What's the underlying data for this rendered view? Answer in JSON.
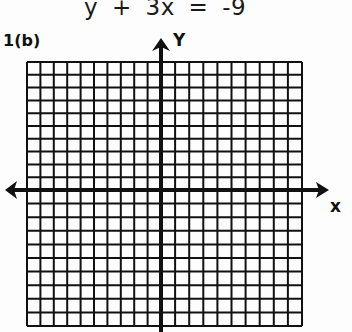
{
  "header": {
    "equation": "y + 3x = -9"
  },
  "problem": {
    "label": "1(b)"
  },
  "graph": {
    "x_axis_label": "x",
    "y_axis_label": "Y",
    "grid_columns": 20,
    "grid_rows": 20,
    "x_range": [
      -10,
      10
    ],
    "y_range": [
      -10,
      10
    ],
    "line_color": "#111111",
    "background_color": "#fdfdfd"
  }
}
